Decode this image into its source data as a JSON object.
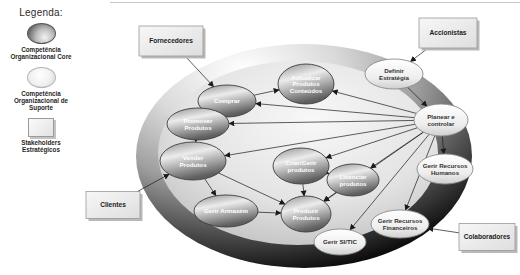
{
  "legend": {
    "title": "Legenda:",
    "items": [
      {
        "swatch": "core",
        "label": "Competência\nOrganizacional Core"
      },
      {
        "swatch": "support",
        "label": "Competência\nOrganizacional de\nSuporte"
      },
      {
        "swatch": "stakeholder",
        "label": "Stakeholders\nEstratégicos"
      }
    ]
  },
  "colors": {
    "background": "#ffffff",
    "line": "#1a1a1a",
    "core_text": "#ffffff",
    "support_text": "#333333",
    "stakeholder_text": "#1c1c1c",
    "ring_light": "#ffffff",
    "ring_mid": "#9e9e9e",
    "ring_dark": "#0d0d0d",
    "inner_light": "#f8f8f8",
    "inner_dark": "#9f9f9f",
    "core_hi": "#ececec",
    "core_lo": "#5f5f5f",
    "support_hi": "#ffffff",
    "support_lo": "#cfcfcf",
    "box_hi": "#f7f7f7",
    "box_lo": "#dedede"
  },
  "diagram": {
    "boundary": {
      "cx": 304,
      "cy": 156,
      "rx": 168,
      "ry": 112,
      "inner_rx": 140,
      "inner_ry": 92,
      "inner_cx": 298,
      "inner_cy": 153
    },
    "nodes": [
      {
        "id": "fornecedores",
        "type": "stakeholder",
        "label": "Fornecedores",
        "cx": 171,
        "cy": 41,
        "w": 64,
        "h": 30
      },
      {
        "id": "accionistas",
        "type": "stakeholder",
        "label": "Accionistas",
        "cx": 448,
        "cy": 33,
        "w": 58,
        "h": 30
      },
      {
        "id": "clientes",
        "type": "stakeholder",
        "label": "Clientes",
        "cx": 113,
        "cy": 205,
        "w": 54,
        "h": 27
      },
      {
        "id": "colaboradores",
        "type": "stakeholder",
        "label": "Colaboradores",
        "cx": 487,
        "cy": 237,
        "w": 56,
        "h": 27
      },
      {
        "id": "comprar",
        "type": "core",
        "label": "Comprar",
        "cx": 227,
        "cy": 101,
        "w": 58,
        "h": 32
      },
      {
        "id": "actualizar",
        "type": "core",
        "label": "Actualizar\nProdutos\nConteúdos",
        "cx": 306,
        "cy": 84,
        "w": 56,
        "h": 40
      },
      {
        "id": "promover",
        "type": "core",
        "label": "Promover\nProdutos",
        "cx": 198,
        "cy": 124,
        "w": 62,
        "h": 32
      },
      {
        "id": "vender",
        "type": "core",
        "label": "Vender\nProdutos",
        "cx": 193,
        "cy": 161,
        "w": 66,
        "h": 38
      },
      {
        "id": "criargerir",
        "type": "core",
        "label": "Criar/Gerir\nprodutos",
        "cx": 301,
        "cy": 166,
        "w": 56,
        "h": 36
      },
      {
        "id": "licenciar",
        "type": "core",
        "label": "Licenciar\nprodutos",
        "cx": 353,
        "cy": 180,
        "w": 52,
        "h": 32
      },
      {
        "id": "armazem",
        "type": "core",
        "label": "Gerir Armazém",
        "cx": 226,
        "cy": 211,
        "w": 64,
        "h": 32
      },
      {
        "id": "produzir",
        "type": "core",
        "label": "Produzir\nProdutos",
        "cx": 306,
        "cy": 214,
        "w": 50,
        "h": 36
      },
      {
        "id": "definir",
        "type": "support",
        "label": "Definir\nEstratégia",
        "cx": 394,
        "cy": 74,
        "w": 58,
        "h": 30
      },
      {
        "id": "planear",
        "type": "support",
        "label": "Planear e\ncontrolar",
        "cx": 441,
        "cy": 120,
        "w": 54,
        "h": 32
      },
      {
        "id": "grh",
        "type": "support",
        "label": "Gerir Recursos\nHumanos",
        "cx": 445,
        "cy": 169,
        "w": 56,
        "h": 30
      },
      {
        "id": "grf",
        "type": "support",
        "label": "Gerir Recursos\nFinanceiros",
        "cx": 400,
        "cy": 224,
        "w": 58,
        "h": 28
      },
      {
        "id": "sitic",
        "type": "support",
        "label": "Gerir SI/TIC",
        "cx": 340,
        "cy": 242,
        "w": 52,
        "h": 26
      }
    ],
    "edges": [
      {
        "from": "accionistas",
        "to": "definir"
      },
      {
        "from": "fornecedores",
        "to": "comprar"
      },
      {
        "from": "clientes",
        "to": "vender"
      },
      {
        "from": "colaboradores",
        "to": "grf"
      },
      {
        "from": "definir",
        "to": "planear"
      },
      {
        "from": "planear",
        "to": "actualizar"
      },
      {
        "from": "planear",
        "to": "comprar"
      },
      {
        "from": "planear",
        "to": "promover"
      },
      {
        "from": "planear",
        "to": "vender"
      },
      {
        "from": "planear",
        "to": "criargerir"
      },
      {
        "from": "planear",
        "to": "licenciar"
      },
      {
        "from": "planear",
        "to": "produzir"
      },
      {
        "from": "planear",
        "to": "grh"
      },
      {
        "from": "planear",
        "to": "grf"
      },
      {
        "from": "planear",
        "to": "sitic"
      },
      {
        "from": "comprar",
        "to": "actualizar"
      },
      {
        "from": "promover",
        "to": "vender"
      },
      {
        "from": "vender",
        "to": "armazem"
      },
      {
        "from": "vender",
        "to": "produzir"
      },
      {
        "from": "armazem",
        "to": "produzir"
      },
      {
        "from": "criargerir",
        "to": "produzir"
      },
      {
        "from": "criargerir",
        "to": "licenciar"
      },
      {
        "from": "licenciar",
        "to": "produzir"
      }
    ]
  }
}
